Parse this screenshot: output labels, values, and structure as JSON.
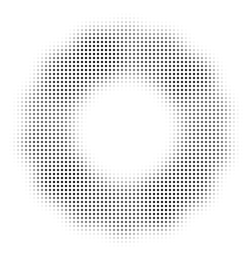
{
  "image": {
    "description": "Halftone dot ring / wreath of lobed blobs on white background",
    "width": 252,
    "height": 260,
    "background": "#ffffff",
    "dot_color": "#1a1a1a",
    "dot_spacing": 4,
    "ring": {
      "center_x": 126,
      "center_y": 130,
      "outer_radius": 103,
      "inner_radius": 55,
      "lobe_count": 14,
      "lobes": [
        {
          "angle": -90,
          "darkness": 0.55
        },
        {
          "angle": -64,
          "darkness": 0.75
        },
        {
          "angle": -38,
          "darkness": 0.9
        },
        {
          "angle": -12,
          "darkness": 0.6
        },
        {
          "angle": 14,
          "darkness": 0.7
        },
        {
          "angle": 40,
          "darkness": 0.85
        },
        {
          "angle": 66,
          "darkness": 0.95
        },
        {
          "angle": 92,
          "darkness": 0.7
        },
        {
          "angle": 118,
          "darkness": 0.8
        },
        {
          "angle": 144,
          "darkness": 0.95
        },
        {
          "angle": 170,
          "darkness": 0.75
        },
        {
          "angle": 196,
          "darkness": 0.6
        },
        {
          "angle": 222,
          "darkness": 0.85
        },
        {
          "angle": 248,
          "darkness": 0.95
        }
      ]
    }
  }
}
